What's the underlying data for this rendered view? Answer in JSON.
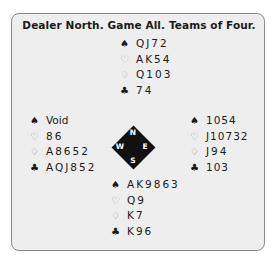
{
  "title": "Dealer North. Game All. Teams of Four.",
  "suit_symbols": {
    "spades": "♠",
    "hearts": "♡",
    "diamonds": "♢",
    "clubs": "♣"
  },
  "hands": {
    "north": {
      "spades": "QJ72",
      "hearts": "AK54",
      "diamonds": "Q103",
      "clubs": "74"
    },
    "west": {
      "spades": "Void",
      "hearts": "86",
      "diamonds": "A8652",
      "clubs": "AQJ852"
    },
    "east": {
      "spades": "1054",
      "hearts": "J10732",
      "diamonds": "J94",
      "clubs": "103"
    },
    "south": {
      "spades": "AK9863",
      "hearts": "Q9",
      "diamonds": "K7",
      "clubs": "K96"
    }
  },
  "compass": {
    "n": "N",
    "e": "E",
    "s": "S",
    "w": "W"
  }
}
